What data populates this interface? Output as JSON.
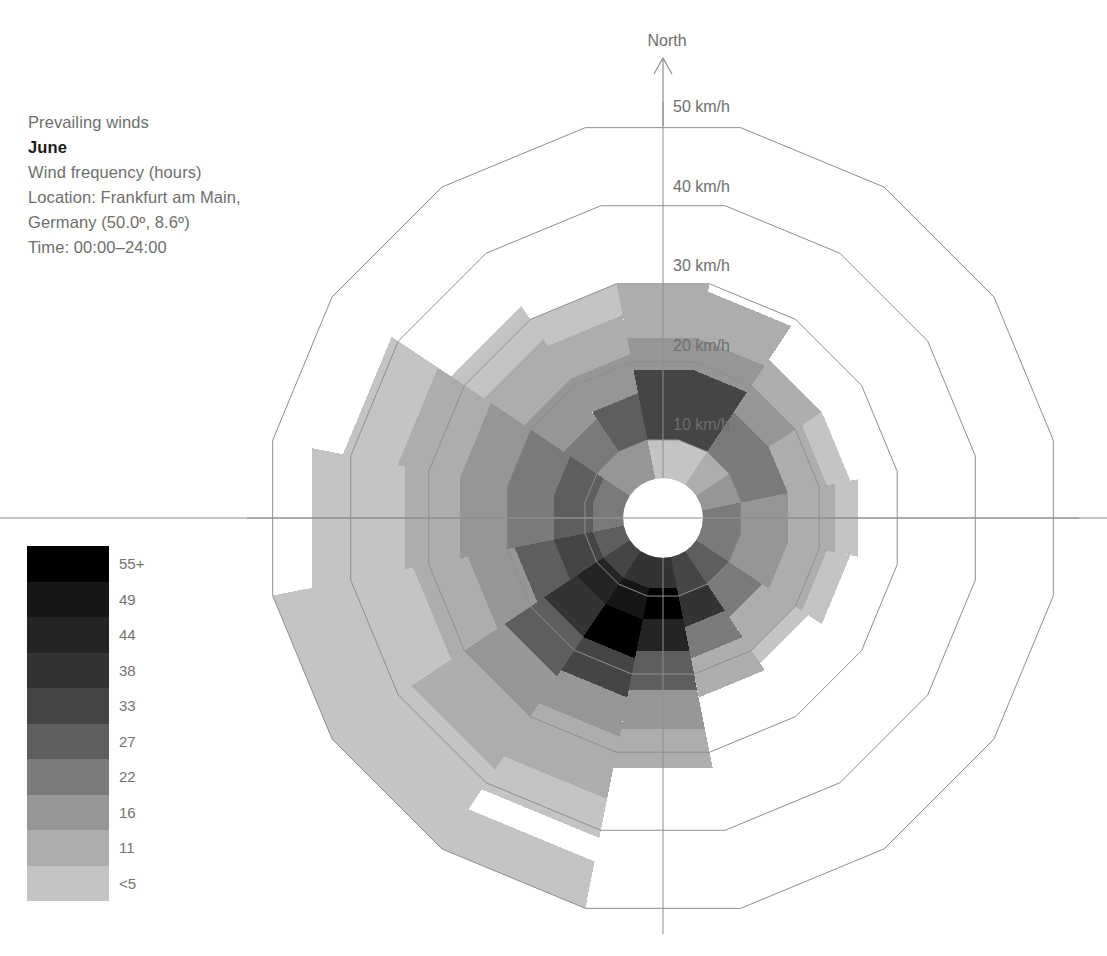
{
  "caption": {
    "line1": "Prevailing winds",
    "line2": "June",
    "line3": "Wind frequency (hours)",
    "line4": "Location: Frankfurt am Main,",
    "line5": "Germany (50.0º, 8.6º)",
    "line6": "Time: 00:00–24:00"
  },
  "legend": {
    "title": "Wind frequency (hours)",
    "labels": [
      "55+",
      "49",
      "44",
      "38",
      "33",
      "27",
      "22",
      "16",
      "11",
      "<5"
    ],
    "colors": [
      "#000000",
      "#161616",
      "#242424",
      "#333333",
      "#454545",
      "#5e5e5e",
      "#7a7a7a",
      "#969696",
      "#adadad",
      "#c4c4c4"
    ]
  },
  "axes": {
    "north_label": "North",
    "ring_labels": [
      "10 km/h",
      "20 km/h",
      "30 km/h",
      "40 km/h",
      "50 km/h"
    ],
    "ring_values": [
      10,
      20,
      30,
      40,
      50
    ]
  },
  "chart_data": {
    "type": "windrose",
    "subtitle": "Wind frequency (hours)",
    "location": "Frankfurt am Main, Germany (50.0º, 8.6º)",
    "time_range": "00:00–24:00",
    "radial_axis_label": "km/h",
    "radial_ticks": [
      10,
      20,
      30,
      40,
      50
    ],
    "rmax": 55,
    "rmin_hole": 5,
    "n_sectors": 16,
    "directions": [
      "N",
      "NNE",
      "NE",
      "ENE",
      "E",
      "ESE",
      "SE",
      "SSE",
      "S",
      "SSW",
      "SW",
      "WSW",
      "W",
      "WNW",
      "NW",
      "NNW"
    ],
    "frequency_bins": [
      "<5",
      "11",
      "16",
      "22",
      "27",
      "33",
      "38",
      "44",
      "49",
      "55+"
    ],
    "bin_colors": [
      "#c4c4c4",
      "#adadad",
      "#969696",
      "#7a7a7a",
      "#5e5e5e",
      "#454545",
      "#333333",
      "#242424",
      "#161616",
      "#000000"
    ],
    "legend_position": "left",
    "grid": true,
    "note": "Each sector is a stack of speed-band segments; r0/r1 are km/h radii, bin indexes the colour scale (0 = lightest '<5', 9 = darkest '55+').",
    "sectors": [
      {
        "dir": "N",
        "segments": [
          {
            "r0": 5,
            "r1": 10,
            "bin": 0
          },
          {
            "r0": 10,
            "r1": 19,
            "bin": 5
          },
          {
            "r0": 19,
            "r1": 23,
            "bin": 2
          },
          {
            "r0": 23,
            "r1": 30,
            "bin": 1
          }
        ]
      },
      {
        "dir": "NNE",
        "segments": [
          {
            "r0": 5,
            "r1": 10,
            "bin": 0
          },
          {
            "r0": 10,
            "r1": 19,
            "bin": 5
          },
          {
            "r0": 19,
            "r1": 23,
            "bin": 2
          },
          {
            "r0": 23,
            "r1": 29,
            "bin": 1
          }
        ]
      },
      {
        "dir": "NE",
        "segments": [
          {
            "r0": 5,
            "r1": 10,
            "bin": 1
          },
          {
            "r0": 10,
            "r1": 16,
            "bin": 3
          },
          {
            "r0": 16,
            "r1": 20,
            "bin": 2
          },
          {
            "r0": 20,
            "r1": 24,
            "bin": 1
          }
        ]
      },
      {
        "dir": "ENE",
        "segments": [
          {
            "r0": 5,
            "r1": 10,
            "bin": 2
          },
          {
            "r0": 10,
            "r1": 16,
            "bin": 3
          },
          {
            "r0": 16,
            "r1": 21,
            "bin": 1
          },
          {
            "r0": 21,
            "r1": 24,
            "bin": 0
          }
        ]
      },
      {
        "dir": "E",
        "segments": [
          {
            "r0": 5,
            "r1": 10,
            "bin": 3
          },
          {
            "r0": 10,
            "r1": 16,
            "bin": 2
          },
          {
            "r0": 16,
            "r1": 22,
            "bin": 1
          },
          {
            "r0": 22,
            "r1": 25,
            "bin": 0
          }
        ]
      },
      {
        "dir": "ESE",
        "segments": [
          {
            "r0": 5,
            "r1": 10,
            "bin": 3
          },
          {
            "r0": 10,
            "r1": 16,
            "bin": 2
          },
          {
            "r0": 16,
            "r1": 21,
            "bin": 1
          },
          {
            "r0": 21,
            "r1": 24,
            "bin": 0
          }
        ]
      },
      {
        "dir": "SE",
        "segments": [
          {
            "r0": 5,
            "r1": 10,
            "bin": 4
          },
          {
            "r0": 10,
            "r1": 15,
            "bin": 3
          },
          {
            "r0": 15,
            "r1": 20,
            "bin": 1
          },
          {
            "r0": 20,
            "r1": 22,
            "bin": 0
          }
        ]
      },
      {
        "dir": "SSE",
        "segments": [
          {
            "r0": 5,
            "r1": 10,
            "bin": 5
          },
          {
            "r0": 10,
            "r1": 14,
            "bin": 6
          },
          {
            "r0": 14,
            "r1": 18,
            "bin": 3
          },
          {
            "r0": 18,
            "r1": 23,
            "bin": 1
          }
        ]
      },
      {
        "dir": "S",
        "segments": [
          {
            "r0": 5,
            "r1": 9,
            "bin": 6
          },
          {
            "r0": 9,
            "r1": 13,
            "bin": 9
          },
          {
            "r0": 13,
            "r1": 17,
            "bin": 7
          },
          {
            "r0": 17,
            "r1": 22,
            "bin": 4
          },
          {
            "r0": 22,
            "r1": 27,
            "bin": 2
          },
          {
            "r0": 27,
            "r1": 32,
            "bin": 1
          }
        ]
      },
      {
        "dir": "SSW",
        "segments": [
          {
            "r0": 5,
            "r1": 9,
            "bin": 6
          },
          {
            "r0": 9,
            "r1": 13,
            "bin": 8
          },
          {
            "r0": 13,
            "r1": 18,
            "bin": 9
          },
          {
            "r0": 18,
            "r1": 23,
            "bin": 5
          },
          {
            "r0": 23,
            "r1": 28,
            "bin": 2
          },
          {
            "r0": 28,
            "r1": 36,
            "bin": 1
          },
          {
            "r0": 36,
            "r1": 41,
            "bin": 0
          },
          {
            "r0": 44,
            "r1": 50,
            "bin": 0
          }
        ]
      },
      {
        "dir": "SW",
        "segments": [
          {
            "r0": 5,
            "r1": 9,
            "bin": 5
          },
          {
            "r0": 9,
            "r1": 13,
            "bin": 7
          },
          {
            "r0": 13,
            "r1": 18,
            "bin": 6
          },
          {
            "r0": 18,
            "r1": 24,
            "bin": 4
          },
          {
            "r0": 24,
            "r1": 30,
            "bin": 2
          },
          {
            "r0": 30,
            "r1": 38,
            "bin": 1
          },
          {
            "r0": 38,
            "r1": 50,
            "bin": 0
          }
        ]
      },
      {
        "dir": "WSW",
        "segments": [
          {
            "r0": 5,
            "r1": 9,
            "bin": 4
          },
          {
            "r0": 9,
            "r1": 14,
            "bin": 5
          },
          {
            "r0": 14,
            "r1": 19,
            "bin": 4
          },
          {
            "r0": 19,
            "r1": 25,
            "bin": 2
          },
          {
            "r0": 25,
            "r1": 32,
            "bin": 1
          },
          {
            "r0": 32,
            "r1": 50,
            "bin": 0
          }
        ]
      },
      {
        "dir": "W",
        "segments": [
          {
            "r0": 5,
            "r1": 9,
            "bin": 3
          },
          {
            "r0": 9,
            "r1": 14,
            "bin": 4
          },
          {
            "r0": 14,
            "r1": 20,
            "bin": 3
          },
          {
            "r0": 20,
            "r1": 26,
            "bin": 2
          },
          {
            "r0": 26,
            "r1": 33,
            "bin": 1
          },
          {
            "r0": 33,
            "r1": 45,
            "bin": 0
          }
        ]
      },
      {
        "dir": "WNW",
        "segments": [
          {
            "r0": 5,
            "r1": 9,
            "bin": 3
          },
          {
            "r0": 9,
            "r1": 14,
            "bin": 4
          },
          {
            "r0": 14,
            "r1": 20,
            "bin": 3
          },
          {
            "r0": 20,
            "r1": 26,
            "bin": 2
          },
          {
            "r0": 26,
            "r1": 34,
            "bin": 1
          },
          {
            "r0": 34,
            "r1": 41,
            "bin": 0
          }
        ]
      },
      {
        "dir": "NW",
        "segments": [
          {
            "r0": 5,
            "r1": 10,
            "bin": 2
          },
          {
            "r0": 10,
            "r1": 15,
            "bin": 3
          },
          {
            "r0": 15,
            "r1": 21,
            "bin": 2
          },
          {
            "r0": 21,
            "r1": 27,
            "bin": 1
          },
          {
            "r0": 27,
            "r1": 32,
            "bin": 0
          }
        ]
      },
      {
        "dir": "NNW",
        "segments": [
          {
            "r0": 5,
            "r1": 10,
            "bin": 2
          },
          {
            "r0": 10,
            "r1": 16,
            "bin": 4
          },
          {
            "r0": 16,
            "r1": 21,
            "bin": 2
          },
          {
            "r0": 21,
            "r1": 26,
            "bin": 1
          },
          {
            "r0": 26,
            "r1": 30,
            "bin": 0
          }
        ]
      }
    ]
  }
}
